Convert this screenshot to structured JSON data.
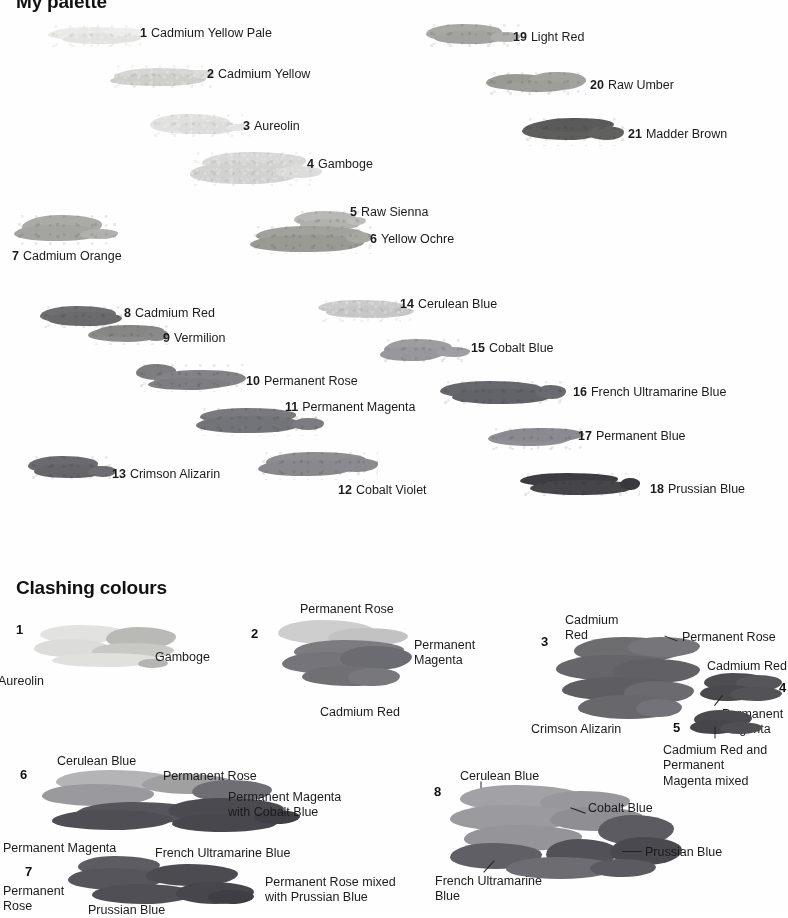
{
  "document": {
    "kind": "watercolour-palette-reference-page",
    "background": "#fefefe",
    "ink": "#1b1b1b"
  },
  "sections": {
    "palette": {
      "title": "My palette"
    },
    "clashing": {
      "title": "Clashing colours"
    }
  },
  "palette": {
    "swatches": [
      {
        "num": "1",
        "name": "Cadmium Yellow Pale",
        "tone": "#e9e9e6"
      },
      {
        "num": "2",
        "name": "Cadmium Yellow",
        "tone": "#d4d4d1"
      },
      {
        "num": "3",
        "name": "Aureolin",
        "tone": "#dedede"
      },
      {
        "num": "4",
        "name": "Gamboge",
        "tone": "#d6d6d4"
      },
      {
        "num": "5",
        "name": "Raw Sienna",
        "tone": "#b6b6b2"
      },
      {
        "num": "6",
        "name": "Yellow Ochre",
        "tone": "#9e9e99"
      },
      {
        "num": "7",
        "name": "Cadmium Orange",
        "tone": "#a8a8a4"
      },
      {
        "num": "8",
        "name": "Cadmium Red",
        "tone": "#6e6e70"
      },
      {
        "num": "9",
        "name": "Vermilion",
        "tone": "#8a8a88"
      },
      {
        "num": "10",
        "name": "Permanent Rose",
        "tone": "#818185"
      },
      {
        "num": "11",
        "name": "Permanent Magenta",
        "tone": "#77777c"
      },
      {
        "num": "12",
        "name": "Cobalt Violet",
        "tone": "#8b8b90"
      },
      {
        "num": "13",
        "name": "Crimson Alizarin",
        "tone": "#6a6a6e"
      },
      {
        "num": "14",
        "name": "Cerulean Blue",
        "tone": "#c9c9c9"
      },
      {
        "num": "15",
        "name": "Cobalt Blue",
        "tone": "#9a9a9f"
      },
      {
        "num": "16",
        "name": "French Ultramarine Blue",
        "tone": "#66666d"
      },
      {
        "num": "17",
        "name": "Permanent Blue",
        "tone": "#8d8d93"
      },
      {
        "num": "18",
        "name": "Prussian Blue",
        "tone": "#3c3c40"
      },
      {
        "num": "19",
        "name": "Light Red",
        "tone": "#a6a6a3"
      },
      {
        "num": "20",
        "name": "Raw Umber",
        "tone": "#9d9d98"
      },
      {
        "num": "21",
        "name": "Madder Brown",
        "tone": "#5d5d5c"
      }
    ]
  },
  "clashing": {
    "groups": [
      {
        "num": "1",
        "labels": [
          "Gamboge",
          "Aureolin"
        ]
      },
      {
        "num": "2",
        "labels": [
          "Permanent Rose",
          "Permanent\nMagenta",
          "Cadmium Red"
        ]
      },
      {
        "num": "3",
        "labels": [
          "Cadmium\nRed",
          "Permanent Rose",
          "Crimson Alizarin"
        ]
      },
      {
        "num": "4",
        "labels": [
          "Cadmium Red",
          "Permanent\nMagenta"
        ]
      },
      {
        "num": "5",
        "labels": [
          "Cadmium Red and\nPermanent\nMagenta mixed"
        ]
      },
      {
        "num": "6",
        "labels": [
          "Cerulean Blue",
          "Permanent Rose",
          "Permanent Magenta\nwith Cobalt Blue",
          "Permanent Magenta",
          "French Ultramarine Blue"
        ]
      },
      {
        "num": "7",
        "labels": [
          "Permanent\nRose",
          "Prussian Blue",
          "Permanent Rose mixed\nwith Prussian Blue"
        ]
      },
      {
        "num": "8",
        "labels": [
          "Cerulean Blue",
          "Cobalt Blue",
          "Prussian Blue",
          "French Ultramarine\nBlue"
        ]
      }
    ]
  }
}
